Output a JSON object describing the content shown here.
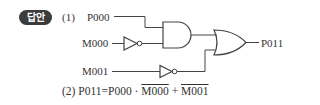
{
  "badge": {
    "label": "답안",
    "color": "#3b3b3b"
  },
  "part1": {
    "number": "(1)",
    "inputs": {
      "p000": "P000",
      "m000": "M000",
      "m001": "M001"
    },
    "output": "P011",
    "gates": [
      "not-m000",
      "and",
      "not-m001",
      "or"
    ]
  },
  "part2": {
    "number": "(2)",
    "lhs": "P011",
    "eq": "=",
    "term1": "P000",
    "dot": "·",
    "term2": "M000",
    "plus": "+",
    "term3": "M001"
  }
}
